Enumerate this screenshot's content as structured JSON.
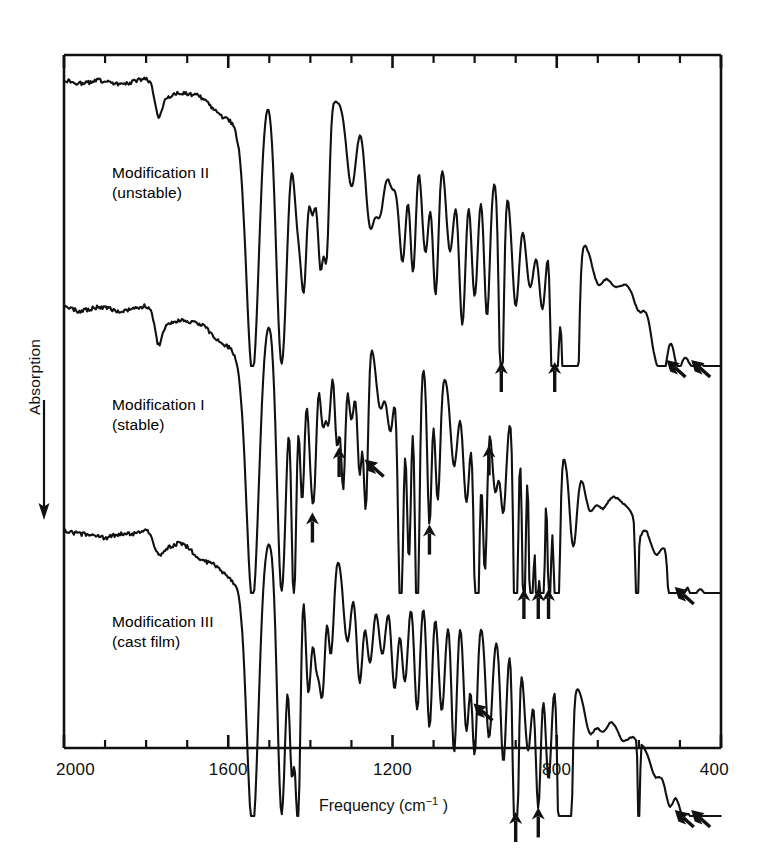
{
  "figure": {
    "x_axis": {
      "title_main": "Frequency (cm",
      "title_sup": "−1",
      "title_close": " )",
      "label": "Frequency (cm−1)",
      "ticks_labeled": [
        2000,
        1600,
        1200,
        800,
        400
      ],
      "tick_step": 100,
      "min": 400,
      "max": 2000,
      "direction": "decreasing"
    },
    "y_axis": {
      "label": "Absorption",
      "arrow_direction": "down",
      "unit": "arbitrary"
    },
    "frame": {
      "left_px": 64,
      "right_px": 721,
      "top_px": 55,
      "bottom_px": 748
    },
    "line_color": "#111111",
    "background_color": "#ffffff"
  },
  "chart_data": {
    "type": "line",
    "title": "",
    "subtitle": "",
    "xlabel": "Frequency (cm−1)",
    "ylabel": "Absorption",
    "xlim": [
      2000,
      400
    ],
    "ylim": [
      0,
      1
    ],
    "grid": false,
    "legend": "none",
    "panels": [
      {
        "name": "Modification II",
        "label_line1": "Modification II",
        "label_line2": "(unstable)",
        "label_x_px": 112,
        "label_y_px": 163,
        "baseline_px": 78,
        "band_px": 288,
        "peaks_cm1": [
          1735,
          1530,
          1455,
          1410,
          1375,
          1330,
          1300,
          1265,
          1230,
          1175,
          1140,
          1100,
          1050,
          1010,
          960,
          915,
          870,
          760,
          690,
          610,
          545,
          500
        ],
        "arrows": [
          {
            "cm1": 935,
            "style": "vertical"
          },
          {
            "cm1": 805,
            "style": "vertical"
          },
          {
            "cm1": 540,
            "style": "diagonal"
          },
          {
            "cm1": 480,
            "style": "diagonal"
          }
        ]
      },
      {
        "name": "Modification I",
        "label_line1": "Modification I",
        "label_line2": "(stable)",
        "label_x_px": 112,
        "label_y_px": 395,
        "baseline_px": 305,
        "band_px": 288,
        "peaks_cm1": [
          1735,
          1530,
          1465,
          1420,
          1375,
          1340,
          1300,
          1265,
          1230,
          1195,
          1160,
          1120,
          1080,
          1040,
          995,
          950,
          900,
          860,
          825,
          795,
          760,
          720,
          600,
          520
        ],
        "arrows": [
          {
            "cm1": 1395,
            "style": "vertical"
          },
          {
            "cm1": 1330,
            "style": "vertical"
          },
          {
            "cm1": 1275,
            "style": "diagonal"
          },
          {
            "cm1": 1110,
            "style": "vertical"
          },
          {
            "cm1": 965,
            "style": "vertical"
          },
          {
            "cm1": 880,
            "style": "vertical"
          },
          {
            "cm1": 845,
            "style": "vertical"
          },
          {
            "cm1": 820,
            "style": "vertical"
          },
          {
            "cm1": 520,
            "style": "diagonal"
          }
        ]
      },
      {
        "name": "Modification III",
        "label_line1": "Modification III",
        "label_line2": "(cast film)",
        "label_x_px": 112,
        "label_y_px": 612,
        "baseline_px": 528,
        "band_px": 288,
        "peaks_cm1": [
          1730,
          1530,
          1460,
          1415,
          1370,
          1330,
          1300,
          1265,
          1230,
          1180,
          1140,
          1100,
          1050,
          1005,
          960,
          910,
          860,
          760,
          690,
          600,
          520,
          470
        ],
        "arrows": [
          {
            "cm1": 1010,
            "style": "diagonal"
          },
          {
            "cm1": 900,
            "style": "vertical"
          },
          {
            "cm1": 845,
            "style": "vertical"
          },
          {
            "cm1": 520,
            "style": "diagonal"
          },
          {
            "cm1": 480,
            "style": "diagonal"
          }
        ]
      }
    ]
  }
}
